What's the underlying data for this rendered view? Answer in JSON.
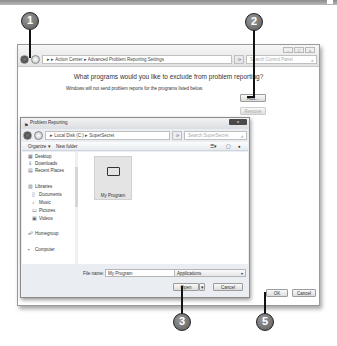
{
  "outer_window": {
    "breadcrumb": [
      "Action Center",
      "Advanced Problem Reporting Settings"
    ],
    "breadcrumb_text": "▸ ▸ Action Center ▸ Advanced Problem Reporting Settings",
    "refresh_icon": "refresh-icon",
    "search_placeholder": "Search Control Panel",
    "heading": "What programs would you like to exclude from problem reporting?",
    "subheading": "Windows will not send problem reports for the programs listed below.",
    "add_button": "Add...",
    "remove_button": "Remove",
    "ok_button": "OK",
    "cancel_button": "Cancel",
    "window_buttons": [
      "minimize",
      "maximize",
      "close"
    ]
  },
  "dialog": {
    "title": "Problem Reporting",
    "close_label": "x",
    "breadcrumb_text": "▸ Local Disk (C:) ▸ SuperSecret",
    "search_placeholder": "Search SuperSecret",
    "toolbar": {
      "organize": "Organize ▾",
      "new_folder": "New folder"
    },
    "nav_items": [
      {
        "label": "Desktop",
        "icon": "desktop-icon"
      },
      {
        "label": "Downloads",
        "icon": "downloads-icon"
      },
      {
        "label": "Recent Places",
        "icon": "recent-places-icon"
      },
      {
        "label": "Libraries",
        "icon": "libraries-icon"
      },
      {
        "label": "Documents",
        "icon": "documents-icon"
      },
      {
        "label": "Music",
        "icon": "music-icon"
      },
      {
        "label": "Pictures",
        "icon": "pictures-icon"
      },
      {
        "label": "Videos",
        "icon": "videos-icon"
      },
      {
        "label": "Homegroup",
        "icon": "homegroup-icon"
      },
      {
        "label": "Computer",
        "icon": "computer-icon"
      }
    ],
    "files": [
      {
        "name": "My Program",
        "icon": "folder-icon"
      }
    ],
    "file_name_label": "File name:",
    "file_name_value": "My Program",
    "file_type": "Applications",
    "open_button": "Open",
    "cancel_button": "Cancel"
  },
  "callouts": [
    "1",
    "2",
    "3",
    "5"
  ]
}
